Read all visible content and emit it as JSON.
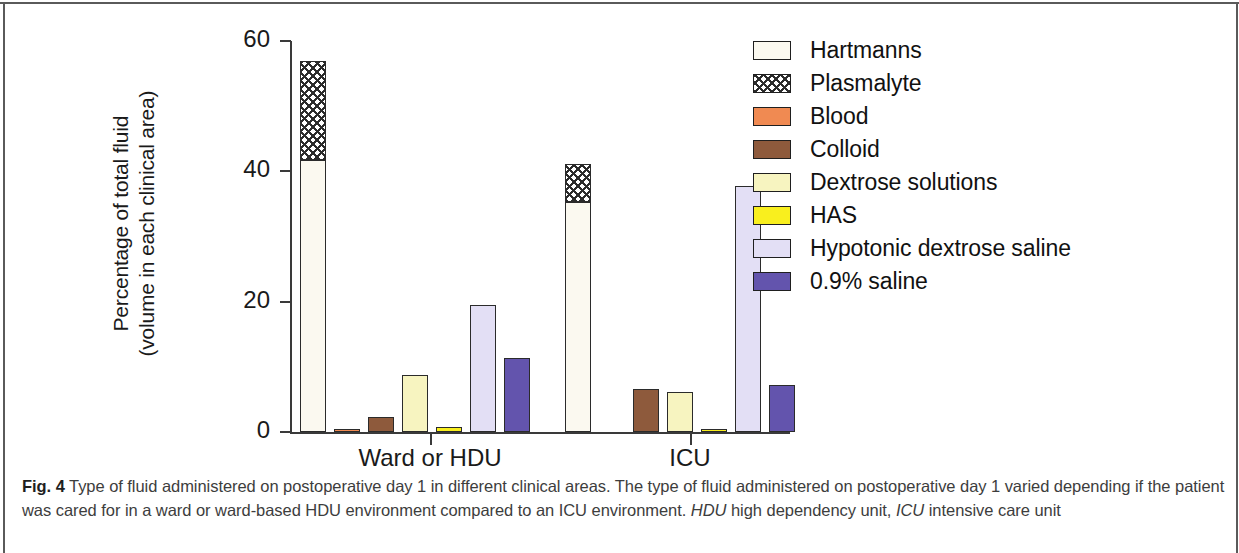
{
  "figure": {
    "caption_prefix": "Fig. 4",
    "caption_text_1": " Type of fluid administered on postoperative day 1 in different clinical areas. The type of fluid administered on postoperative day 1 varied depending if the patient was cared for in a ward or ward-based HDU environment compared to an ICU environment. ",
    "caption_abbr_1": "HDU",
    "caption_text_2": " high dependency unit, ",
    "caption_abbr_2": "ICU",
    "caption_text_3": " intensive care unit"
  },
  "chart_data": {
    "type": "bar",
    "title": "",
    "xlabel": "",
    "ylabel": "Percentage of total fluid\n(volume in each clinical area)",
    "ylim": [
      0,
      60
    ],
    "yticks": [
      0,
      20,
      40,
      60
    ],
    "ytick_labels": [
      "0",
      "20",
      "40",
      "60"
    ],
    "grid": false,
    "legend_position": "right",
    "stacked_note": "Plasmalyte is stacked on top of Hartmanns in the first bar of each group",
    "categories": [
      "Ward or HDU",
      "ICU"
    ],
    "series": [
      {
        "name": "Hartmanns",
        "color": "#fbf9f0",
        "pattern": "solid",
        "values": [
          41.8,
          35.3
        ]
      },
      {
        "name": "Plasmalyte",
        "color": "#ffffff",
        "pattern": "hatch",
        "values": [
          15.2,
          5.9
        ]
      },
      {
        "name": "Blood",
        "color": "#f08a52",
        "pattern": "solid",
        "values": [
          0.5,
          0.0
        ]
      },
      {
        "name": "Colloid",
        "color": "#8e5a3c",
        "pattern": "solid",
        "values": [
          2.3,
          6.6
        ]
      },
      {
        "name": "Dextrose solutions",
        "color": "#f7f4c0",
        "pattern": "solid",
        "values": [
          8.7,
          6.2
        ]
      },
      {
        "name": "HAS",
        "color": "#f9ef1e",
        "pattern": "solid",
        "values": [
          0.7,
          0.4
        ]
      },
      {
        "name": "Hypotonic dextrose saline",
        "color": "#e3dff5",
        "pattern": "solid",
        "values": [
          19.5,
          37.8
        ]
      },
      {
        "name": "0.9% saline",
        "color": "#6354ad",
        "pattern": "solid",
        "values": [
          11.3,
          7.2
        ]
      }
    ]
  },
  "legend": {
    "items": [
      {
        "label": "Hartmanns"
      },
      {
        "label": "Plasmalyte"
      },
      {
        "label": "Blood"
      },
      {
        "label": "Colloid"
      },
      {
        "label": "Dextrose solutions"
      },
      {
        "label": "HAS"
      },
      {
        "label": "Hypotonic dextrose saline"
      },
      {
        "label": "0.9% saline"
      }
    ]
  }
}
